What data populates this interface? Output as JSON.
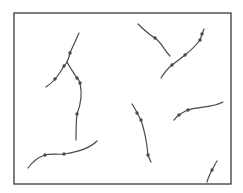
{
  "diagram": {
    "frame": {
      "x": 14,
      "y": 13,
      "width": 217,
      "height": 171,
      "color": "#3a3a3a"
    },
    "fiber_color": "#4a4a4a",
    "node_radius": 1.7,
    "fibers": [
      {
        "id": "branching-fiber-left-arm",
        "path": "M79,33 C75,42 72,48 70,53 C69,57 68,60 67,62 C66,64 65,65 64,66 C61,71 58,76 55,79 C52,83 49,85 46,87",
        "nodes": [
          [
            70,
            53
          ],
          [
            64,
            66
          ],
          [
            55,
            79
          ]
        ]
      },
      {
        "id": "branching-fiber-right-arm",
        "path": "M67,62 C70,68 74,73 77,78 C79,80 80,82 80,83 C82,92 81,104 77,114 C76,122 76,132 76,140",
        "nodes": [
          [
            77,
            78
          ],
          [
            80,
            83
          ],
          [
            77,
            114
          ]
        ]
      },
      {
        "id": "top-middle-fiber",
        "path": "M138,24 C144,30 150,35 155,38 C162,43 164,50 170,56",
        "nodes": [
          [
            155,
            38
          ]
        ]
      },
      {
        "id": "top-right-fiber",
        "path": "M204,29 C203,31 203,32 202,34 C201,36 201,38 200,40 C195,47 190,51 185,55 C180,59 176,62 172,65 C167,69 164,73 161,78",
        "nodes": [
          [
            202,
            34
          ],
          [
            200,
            40
          ],
          [
            185,
            55
          ],
          [
            172,
            65
          ]
        ]
      },
      {
        "id": "bottom-left-fiber",
        "path": "M28,168 C33,161 39,157 45,155 C52,153 58,155 64,154 C78,152 90,148 97,141",
        "nodes": [
          [
            45,
            155
          ],
          [
            64,
            154
          ]
        ]
      },
      {
        "id": "middle-fiber",
        "path": "M132,104 C134,107 136,110 137,113 C139,116 140,118 141,120 C145,132 147,144 148,155 C149,158 150,160 151,162",
        "nodes": [
          [
            137,
            113
          ],
          [
            141,
            120
          ],
          [
            148,
            155
          ]
        ]
      },
      {
        "id": "right-middle-fiber",
        "path": "M174,120 C176,118 177,116 179,115 C182,113 185,111 188,110 C200,106 212,108 223,102",
        "nodes": [
          [
            179,
            115
          ],
          [
            188,
            110
          ]
        ]
      },
      {
        "id": "bottom-right-fiber",
        "path": "M217,161 C215,164 214,167 212,170 C210,174 208,178 207,182",
        "nodes": [
          [
            212,
            170
          ]
        ]
      }
    ]
  }
}
